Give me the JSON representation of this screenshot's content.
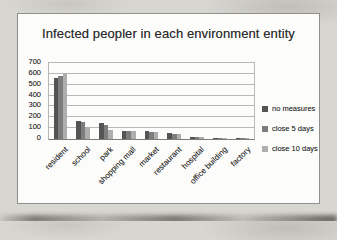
{
  "chart_data": {
    "type": "bar",
    "title": "Infected peopler in each environment entity",
    "categories": [
      "resident",
      "school",
      "park",
      "shopping mall",
      "market",
      "restaurant",
      "hospital",
      "office building",
      "factory"
    ],
    "series": [
      {
        "name": "no measures",
        "color": "#545454",
        "values": [
          560,
          170,
          150,
          75,
          70,
          55,
          18,
          12,
          12
        ]
      },
      {
        "name": "close 5 days",
        "color": "#7d7d7d",
        "values": [
          580,
          155,
          130,
          72,
          65,
          50,
          15,
          10,
          10
        ]
      },
      {
        "name": "close 10 days",
        "color": "#aeaeae",
        "values": [
          610,
          110,
          85,
          70,
          63,
          45,
          14,
          10,
          10
        ]
      }
    ],
    "ylim": [
      0,
      700
    ],
    "ytick_step": 100,
    "grid": true,
    "legend_position": "right"
  }
}
